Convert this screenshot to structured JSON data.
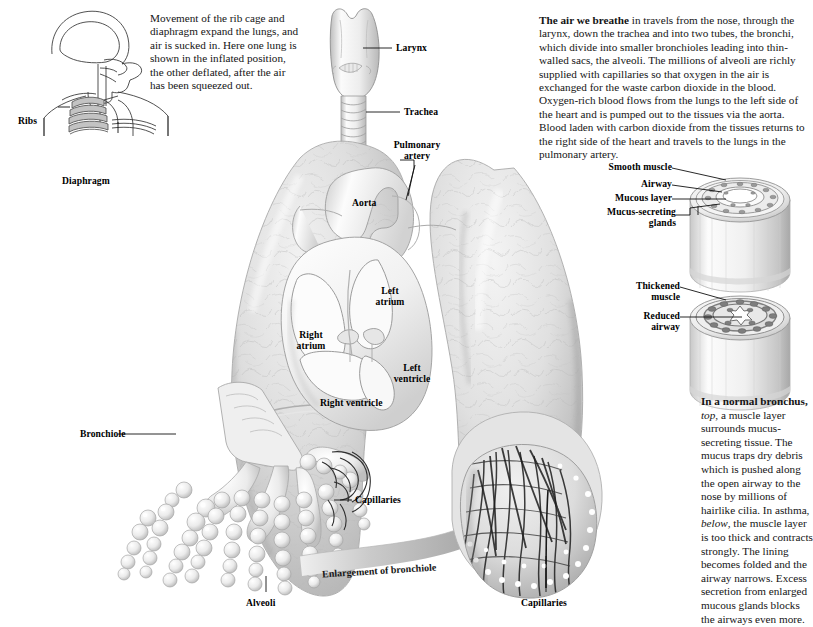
{
  "figure": {
    "background_color": "#ffffff",
    "tissue_color": "#d8d8d8",
    "line_color": "#111111"
  },
  "intro": {
    "text": "Movement of the rib cage and diaphragm expand the lungs, and air is sucked in. Here one lung is shown in the inflated position, the other deflated, after the air has been squeezed out.",
    "lead_bold": "Movement of the rib cage"
  },
  "air_paragraph": {
    "lead_bold": "The air we breathe",
    "text": " in travels from the nose, through the larynx, down the trachea and into two tubes, the bronchi, which divide into smaller bronchioles leading into thin-walled sacs, the alveoli. The millions of alveoli are richly supplied with capillaries so that oxygen in the air is exchanged for the waste carbon dioxide in the blood. Oxygen-rich blood flows from the lungs to the left side of the heart and is pumped out to the tissues via the aorta. Blood laden with carbon dioxide from the tissues returns to the right side of the heart and travels to the lungs in the pulmonary artery."
  },
  "bronchus_paragraph": {
    "lead_bold": "In a normal bronchus,",
    "italic_1": "top",
    "part_1": ", a muscle layer surrounds mucus-secreting tissue. The mucus traps dry debris which is pushed along the open airway to the nose by millions of hairlike cilia. In asthma, ",
    "italic_2": "below",
    "part_2": ", the muscle layer is too thick and contracts strongly. The lining becomes folded and the airway narrows. Excess secretion from enlarged mucous glands blocks the airways even more."
  },
  "torso_labels": {
    "ribs": "Ribs",
    "diaphragm": "Diaphragm"
  },
  "airway_labels": {
    "larynx": "Larynx",
    "trachea": "Trachea"
  },
  "heart_labels": {
    "pulmonary_artery": "Pulmonary artery",
    "pulmonary_artery_line1": "Pulmonary",
    "pulmonary_artery_line2": "artery",
    "aorta": "Aorta",
    "left_atrium_line1": "Left",
    "left_atrium_line2": "atrium",
    "right_atrium_line1": "Right",
    "right_atrium_line2": "atrium",
    "left_ventricle_line1": "Left",
    "left_ventricle_line2": "ventricle",
    "right_ventricle": "Right ventricle"
  },
  "lung_detail_labels": {
    "bronchiole": "Bronchiole",
    "capillaries_left": "Capillaries",
    "alveoli": "Alveoli",
    "enlargement": "Enlargement of bronchiole",
    "capillaries_right": "Capillaries"
  },
  "bronchus_diagram": {
    "normal": {
      "caption_key": "top",
      "labels": [
        "Smooth muscle",
        "Airway",
        "Mucous layer",
        "Mucus-secreting glands"
      ],
      "mucus_secreting_line1": "Mucus-secreting",
      "mucus_secreting_line2": "glands"
    },
    "asthma": {
      "caption_key": "below",
      "labels": [
        "Thickened muscle",
        "Reduced airway"
      ],
      "thickened_line1": "Thickened",
      "thickened_line2": "muscle",
      "reduced_line1": "Reduced",
      "reduced_line2": "airway"
    }
  }
}
